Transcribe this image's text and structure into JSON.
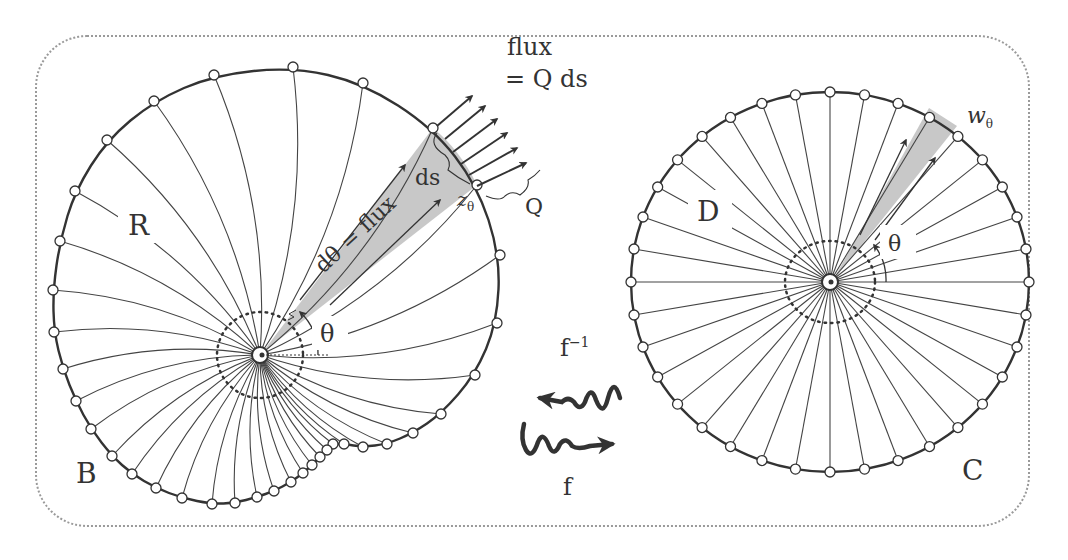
{
  "figure": {
    "left_panel": {
      "region_label": "R",
      "domain_label": "B",
      "angle_label": "θ",
      "strip_label": "dθ = flux",
      "arc_label": "ds",
      "point_label": "z",
      "point_subscript": "θ",
      "flux_label_line1": "flux",
      "flux_label_line2": "= Q ds",
      "density_label": "Q"
    },
    "right_panel": {
      "region_label": "D",
      "domain_label": "C",
      "angle_label": "θ",
      "point_label": "w",
      "point_subscript": "θ"
    },
    "maps": {
      "inverse_label": "f",
      "inverse_superscript": "−1",
      "forward_label": "f"
    },
    "colors": {
      "ink": "#333333",
      "strip_fill": "#c8c8c8",
      "frame": "#9a9a9a",
      "node_fill": "#ffffff"
    }
  }
}
